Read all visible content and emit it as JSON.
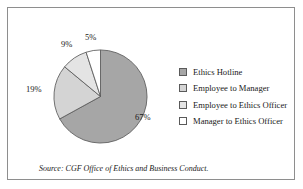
{
  "figure": {
    "source_note": "Source: CGF Office of Ethics and Business Conduct.",
    "border_color": "#8e8e8e",
    "background": "#ffffff"
  },
  "chart_data": {
    "type": "pie",
    "title": "",
    "categories": [
      "Ethics Hotline",
      "Employee to Manager",
      "Employee to Ethics Officer",
      "Manager to Ethics Officer"
    ],
    "values": [
      67,
      19,
      9,
      5
    ],
    "unit": "%",
    "data_labels": [
      "67%",
      "19%",
      "9%",
      "5%"
    ],
    "colors": [
      "#a6a6a6",
      "#d4d4d4",
      "#e4e4e4",
      "#ffffff"
    ],
    "slice_border_color": "#5a5a5a",
    "start_angle_deg": 0,
    "direction": "clockwise",
    "legend_position": "right",
    "grid": false
  },
  "legend": {
    "items": [
      {
        "label": "Ethics Hotline",
        "color": "#a6a6a6"
      },
      {
        "label": "Employee to Manager",
        "color": "#d4d4d4"
      },
      {
        "label": "Employee to Ethics Officer",
        "color": "#e4e4e4"
      },
      {
        "label": "Manager to Ethics Officer",
        "color": "#ffffff"
      }
    ]
  }
}
